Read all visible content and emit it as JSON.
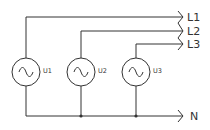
{
  "diagram": {
    "type": "three-phase source schematic",
    "sources": [
      {
        "id": "U1",
        "label": "U1",
        "symbol": "ac-sine",
        "connects_to": "L1"
      },
      {
        "id": "U2",
        "label": "U2",
        "symbol": "ac-sine",
        "connects_to": "L2"
      },
      {
        "id": "U3",
        "label": "U3",
        "symbol": "ac-sine",
        "connects_to": "L3"
      }
    ],
    "outputs": [
      {
        "id": "L1",
        "label": "L1"
      },
      {
        "id": "L2",
        "label": "L2"
      },
      {
        "id": "L3",
        "label": "L3"
      },
      {
        "id": "N",
        "label": "N"
      }
    ],
    "neutral_junctions": 2,
    "line_color": "#333333"
  }
}
